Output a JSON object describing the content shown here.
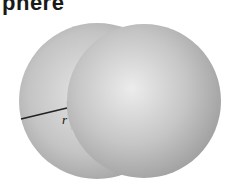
{
  "title": "phere",
  "diagram": {
    "shapes": [
      {
        "name": "left-sphere",
        "cx": 97,
        "cy": 101,
        "r": 78
      },
      {
        "name": "right-sphere",
        "cx": 144,
        "cy": 101,
        "r": 77
      }
    ],
    "radius_line": {
      "x1": 21,
      "y1": 119,
      "x2": 67,
      "y2": 108
    },
    "radius_label": "r",
    "colors": {
      "sphere_light": "#e6e6e6",
      "sphere_dark": "#9a9a9a",
      "line": "#222222"
    }
  }
}
